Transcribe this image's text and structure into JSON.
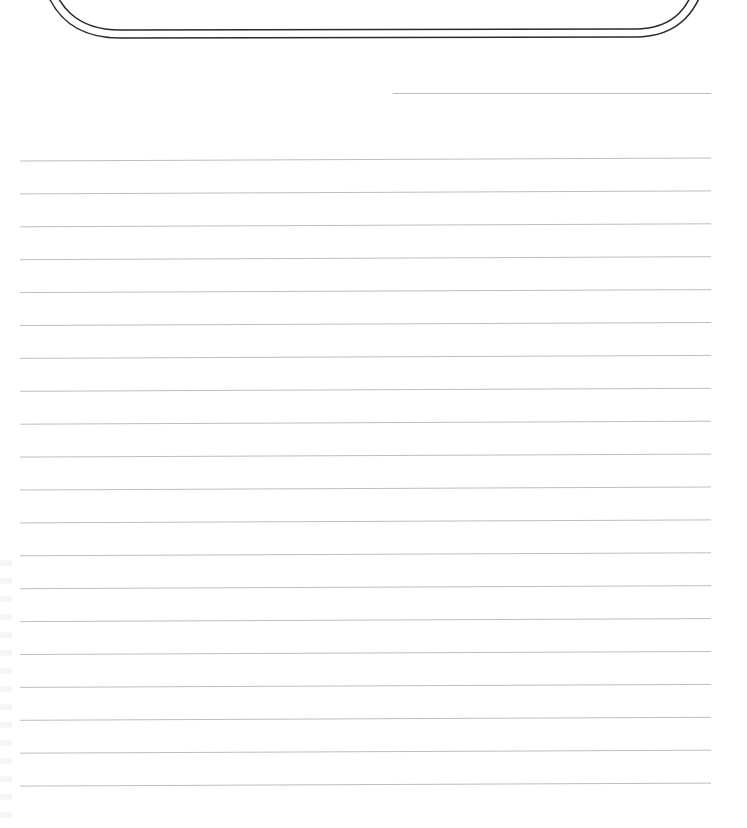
{
  "document": {
    "type": "lined writing paper",
    "header": {
      "title_partial": "",
      "frame": {
        "style": "double-outline rounded banner",
        "stroke_color": "#2a2a2a",
        "outer": {
          "left": 40,
          "right": 708,
          "bottom": 38
        },
        "inner": {
          "left": 48,
          "right": 699,
          "bottom": 30
        }
      }
    },
    "name_line": {
      "x1": 393,
      "x2": 711,
      "y": 93,
      "color": "#bdbdbd"
    },
    "ruled_lines": {
      "count": 20,
      "x1": 20,
      "x2": 711,
      "first_y_left": 161,
      "first_y_right": 158,
      "spacing": 32.9,
      "color": "#bdbdbd"
    },
    "colors": {
      "paper": "#ffffff",
      "frame": "#2a2a2a",
      "rule": "#bdbdbd"
    }
  }
}
